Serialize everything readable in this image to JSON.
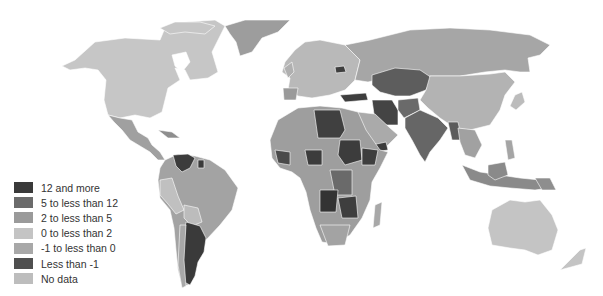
{
  "legend": {
    "items": [
      {
        "label": "12 and more",
        "color": "#3a3a3a"
      },
      {
        "label": "5 to less than 12",
        "color": "#6b6b6b"
      },
      {
        "label": "2 to less than 5",
        "color": "#9a9a9a"
      },
      {
        "label": "0 to less than 2",
        "color": "#c4c4c4"
      },
      {
        "label": "-1 to less than 0",
        "color": "#a8a8a8"
      },
      {
        "label": "Less than -1",
        "color": "#4f4f4f"
      },
      {
        "label": "No data",
        "color": "#bdbdbd"
      }
    ]
  },
  "map": {
    "type": "choropleth world map",
    "region_colors": {
      "north_america": "#c6c6c6",
      "greenland": "#9d9d9d",
      "mexico": "#a0a0a0",
      "south_america": "#a3a3a3",
      "venezuela": "#3c3c3c",
      "argentina": "#3a3a3a",
      "europe": "#b9b9b9",
      "russia": "#a6a6a6",
      "central_asia": "#5d5d5d",
      "china": "#b3b3b3",
      "middle_east": "#444444",
      "india": "#666666",
      "north_africa": "#404040",
      "africa": "#9e9e9e",
      "southeast_asia": "#a1a1a1",
      "australia": "#c4c4c4"
    }
  }
}
